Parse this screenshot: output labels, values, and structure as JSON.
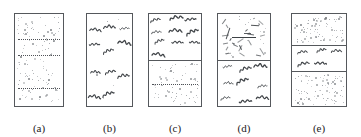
{
  "figure": {
    "width": 361,
    "height": 137,
    "background_color": "#ffffff",
    "border_color": "#55585c",
    "stipple_color": "#8d9196",
    "squiggle_color": "#404448",
    "line_color": "#4f5257",
    "panel_count": 5
  },
  "panels": [
    {
      "id": "a",
      "caption": "(a)",
      "x": 14,
      "width": 50,
      "height": 94,
      "cells": [
        {
          "texture": "stipple",
          "height_fraction": 1,
          "dot_count": 120,
          "rules": [
            {
              "type": "dotted",
              "y_fraction": 0.27
            },
            {
              "type": "dotted",
              "y_fraction": 0.45
            },
            {
              "type": "dotted",
              "y_fraction": 0.8
            }
          ]
        }
      ]
    },
    {
      "id": "b",
      "caption": "(b)",
      "x": 86,
      "width": 47,
      "height": 94,
      "cells": [
        {
          "texture": "squiggle",
          "height_fraction": 1,
          "squiggle_count": 11,
          "dot_count": 6
        }
      ]
    },
    {
      "id": "c",
      "caption": "(c)",
      "x": 148,
      "width": 54,
      "height": 94,
      "cells": [
        {
          "texture": "squiggle",
          "height_fraction": 0.5,
          "squiggle_count": 10,
          "dot_count": 0
        },
        {
          "texture": "stipple",
          "height_fraction": 0.5,
          "dot_count": 70,
          "rules": [
            {
              "type": "dotted",
              "y_fraction": 0.5
            }
          ]
        }
      ]
    },
    {
      "id": "d",
      "caption": "(d)",
      "x": 217,
      "width": 54,
      "height": 94,
      "cells": [
        {
          "texture": "ticks",
          "height_fraction": 0.5,
          "tick_count": 26,
          "dot_count": 14,
          "rules": [
            {
              "type": "solid",
              "y_fraction": 0.5
            }
          ]
        },
        {
          "texture": "squiggle",
          "height_fraction": 0.5,
          "squiggle_count": 9,
          "dot_count": 0
        }
      ]
    },
    {
      "id": "e",
      "caption": "(e)",
      "x": 291,
      "width": 56,
      "height": 94,
      "cells": [
        {
          "texture": "stipple",
          "height_fraction": 0.34,
          "dot_count": 85
        },
        {
          "texture": "squiggle",
          "height_fraction": 0.28,
          "squiggle_count": 5,
          "dot_count": 0
        },
        {
          "texture": "stipple",
          "height_fraction": 0.38,
          "dot_count": 95
        }
      ]
    }
  ]
}
